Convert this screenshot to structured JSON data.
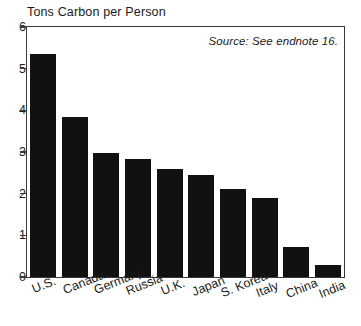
{
  "chart_data": {
    "type": "bar",
    "title": "Tons Carbon per Person",
    "xlabel": "",
    "ylabel": "Tons Carbon per Person",
    "ylim": [
      0,
      6
    ],
    "yticks": [
      0,
      1,
      2,
      3,
      4,
      5,
      6
    ],
    "ytick_labels": [
      "0",
      "1",
      "2",
      "3",
      "4",
      "5",
      "6"
    ],
    "grid": false,
    "legend": "none",
    "categories": [
      "U.S.",
      "Canada",
      "Germany",
      "Russia",
      "U.K.",
      "Japan",
      "S. Korea",
      "Italy",
      "China",
      "India"
    ],
    "values": [
      5.35,
      3.83,
      2.97,
      2.84,
      2.59,
      2.46,
      2.12,
      1.89,
      0.71,
      0.29
    ],
    "annotations": [
      {
        "name": "source-note",
        "text": "Source: See endnote 16.",
        "position": "top-right-inside-plot"
      }
    ],
    "bar_color": "#111111",
    "frame_color": "#3a3a3a",
    "background_color": "#ffffff"
  }
}
